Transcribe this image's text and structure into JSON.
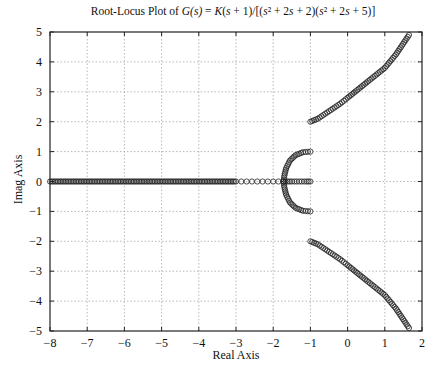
{
  "chart_data": {
    "type": "scatter",
    "title_parts": {
      "prefix": "Root-Locus Plot of ",
      "lhs": "G(s)",
      "eq": " = ",
      "rhs": "K(s + 1)/[(s² + 2s + 2)(s² + 2s + 5)]"
    },
    "xlabel": "Real Axis",
    "ylabel": "Imag Axis",
    "xlim": [
      -8,
      2
    ],
    "ylim": [
      -5,
      5
    ],
    "xticks": [
      -8,
      -7,
      -6,
      -5,
      -4,
      -3,
      -2,
      -1,
      0,
      1,
      2
    ],
    "yticks": [
      -5,
      -4,
      -3,
      -2,
      -1,
      0,
      1,
      2,
      3,
      4,
      5
    ],
    "grid": true,
    "marker": "o",
    "poles": [
      [
        -1,
        1
      ],
      [
        -1,
        -1
      ],
      [
        -1,
        2
      ],
      [
        -1,
        -2
      ]
    ],
    "zeros": [
      [
        -1,
        0
      ]
    ],
    "series": [
      {
        "name": "branch-upper-outer",
        "points": [
          [
            -1.0,
            2.0
          ],
          [
            -0.8,
            2.1
          ],
          [
            -0.5,
            2.35
          ],
          [
            -0.2,
            2.6
          ],
          [
            0.0,
            2.8
          ],
          [
            0.3,
            3.1
          ],
          [
            0.6,
            3.4
          ],
          [
            1.0,
            3.8
          ],
          [
            1.3,
            4.25
          ],
          [
            1.65,
            4.9
          ]
        ]
      },
      {
        "name": "branch-lower-outer",
        "points": [
          [
            -1.0,
            -2.0
          ],
          [
            -0.8,
            -2.1
          ],
          [
            -0.5,
            -2.35
          ],
          [
            -0.2,
            -2.6
          ],
          [
            0.0,
            -2.8
          ],
          [
            0.3,
            -3.1
          ],
          [
            0.6,
            -3.4
          ],
          [
            1.0,
            -3.8
          ],
          [
            1.3,
            -4.25
          ],
          [
            1.65,
            -4.9
          ]
        ]
      },
      {
        "name": "branch-upper-inner",
        "points": [
          [
            -1.0,
            1.0
          ],
          [
            -1.2,
            0.98
          ],
          [
            -1.4,
            0.88
          ],
          [
            -1.55,
            0.7
          ],
          [
            -1.65,
            0.45
          ],
          [
            -1.7,
            0.2
          ],
          [
            -1.72,
            0.0
          ]
        ]
      },
      {
        "name": "branch-lower-inner",
        "points": [
          [
            -1.0,
            -1.0
          ],
          [
            -1.2,
            -0.98
          ],
          [
            -1.4,
            -0.88
          ],
          [
            -1.55,
            -0.7
          ],
          [
            -1.65,
            -0.45
          ],
          [
            -1.7,
            -0.2
          ],
          [
            -1.72,
            0.0
          ]
        ]
      },
      {
        "name": "real-axis-to-zero",
        "points": [
          [
            -1.72,
            0.0
          ],
          [
            -1.5,
            0.0
          ],
          [
            -1.3,
            0.0
          ],
          [
            -1.1,
            0.0
          ],
          [
            -1.0,
            0.0
          ]
        ]
      },
      {
        "name": "real-axis-to-minus-infinity",
        "points": [
          [
            -1.72,
            0.0
          ],
          [
            -2.0,
            0.0
          ],
          [
            -3.0,
            0.0
          ],
          [
            -4.0,
            0.0
          ],
          [
            -5.0,
            0.0
          ],
          [
            -6.0,
            0.0
          ],
          [
            -7.0,
            0.0
          ],
          [
            -8.0,
            0.0
          ]
        ]
      }
    ]
  }
}
